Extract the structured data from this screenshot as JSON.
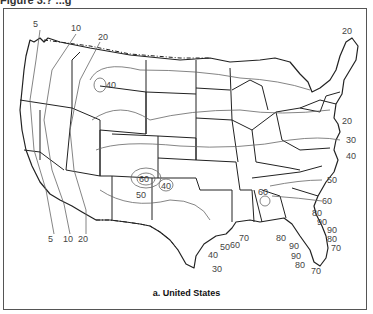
{
  "header": {
    "partial_title": "Figure 3.? ...g"
  },
  "caption": "a. United States",
  "map": {
    "region": "Contiguous United States",
    "style": "black-and-white isoline (contour) map with state boundaries",
    "contour_labels": [
      {
        "value": "5",
        "x": 38,
        "y": 27
      },
      {
        "value": "10",
        "x": 76,
        "y": 31
      },
      {
        "value": "20",
        "x": 103,
        "y": 40
      },
      {
        "value": "40",
        "x": 111,
        "y": 86
      },
      {
        "value": "20",
        "x": 348,
        "y": 34
      },
      {
        "value": "20",
        "x": 345,
        "y": 124
      },
      {
        "value": "30",
        "x": 350,
        "y": 143
      },
      {
        "value": "40",
        "x": 350,
        "y": 158
      },
      {
        "value": "60",
        "x": 143,
        "y": 179
      },
      {
        "value": "50",
        "x": 140,
        "y": 196
      },
      {
        "value": "40",
        "x": 166,
        "y": 187
      },
      {
        "value": "5",
        "x": 50,
        "y": 240
      },
      {
        "value": "10",
        "x": 68,
        "y": 240
      },
      {
        "value": "20",
        "x": 84,
        "y": 240
      },
      {
        "value": "60",
        "x": 263,
        "y": 195
      },
      {
        "value": "50",
        "x": 325,
        "y": 181
      },
      {
        "value": "60",
        "x": 325,
        "y": 201
      },
      {
        "value": "80",
        "x": 315,
        "y": 214
      },
      {
        "value": "90",
        "x": 318,
        "y": 223
      },
      {
        "value": "90",
        "x": 329,
        "y": 232
      },
      {
        "value": "80",
        "x": 329,
        "y": 241
      },
      {
        "value": "70",
        "x": 334,
        "y": 249
      },
      {
        "value": "80",
        "x": 281,
        "y": 241
      },
      {
        "value": "90",
        "x": 292,
        "y": 247
      },
      {
        "value": "90",
        "x": 295,
        "y": 257
      },
      {
        "value": "80",
        "x": 298,
        "y": 266
      },
      {
        "value": "70",
        "x": 312,
        "y": 274
      },
      {
        "value": "70",
        "x": 238,
        "y": 240
      },
      {
        "value": "60",
        "x": 231,
        "y": 247
      },
      {
        "value": "50",
        "x": 219,
        "y": 250
      },
      {
        "value": "40",
        "x": 207,
        "y": 257
      },
      {
        "value": "30",
        "x": 212,
        "y": 270
      }
    ]
  }
}
